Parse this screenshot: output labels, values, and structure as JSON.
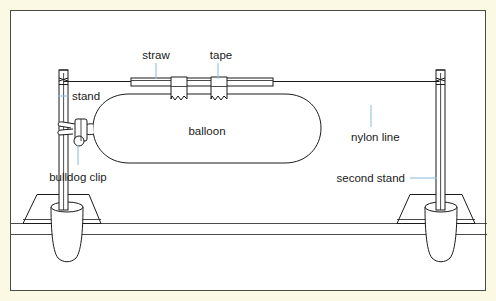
{
  "figure": {
    "kind": "science-diagram",
    "title_visible": false,
    "background_color": "#fbf8e3",
    "panel_color": "#ffffff",
    "border_color": "#4a4a46",
    "ink_color": "#1b1b1b",
    "leader_color": "#8fc2e0"
  },
  "labels": {
    "straw": "straw",
    "tape": "tape",
    "stand": "stand",
    "balloon": "balloon",
    "nylon_line": "nylon line",
    "bulldog_clip": "bulldog clip",
    "second_stand": "second stand"
  },
  "parts": [
    {
      "id": "straw",
      "label": "straw",
      "description": "plastic drinking straw threaded on the nylon line"
    },
    {
      "id": "tape",
      "label": "tape",
      "description": "two strips of sticky tape joining straw to balloon"
    },
    {
      "id": "stand",
      "label": "stand",
      "description": "left retort stand rod clamped to bench"
    },
    {
      "id": "balloon",
      "label": "balloon",
      "description": "inflated sausage balloon taped under the straw"
    },
    {
      "id": "nylon-line",
      "label": "nylon line",
      "description": "taut nylon line stretched between the two stands"
    },
    {
      "id": "bulldog-clip",
      "label": "bulldog clip",
      "description": "clip sealing the balloon neck"
    },
    {
      "id": "second-stand",
      "label": "second stand",
      "description": "right retort stand rod clamped to bench"
    }
  ]
}
